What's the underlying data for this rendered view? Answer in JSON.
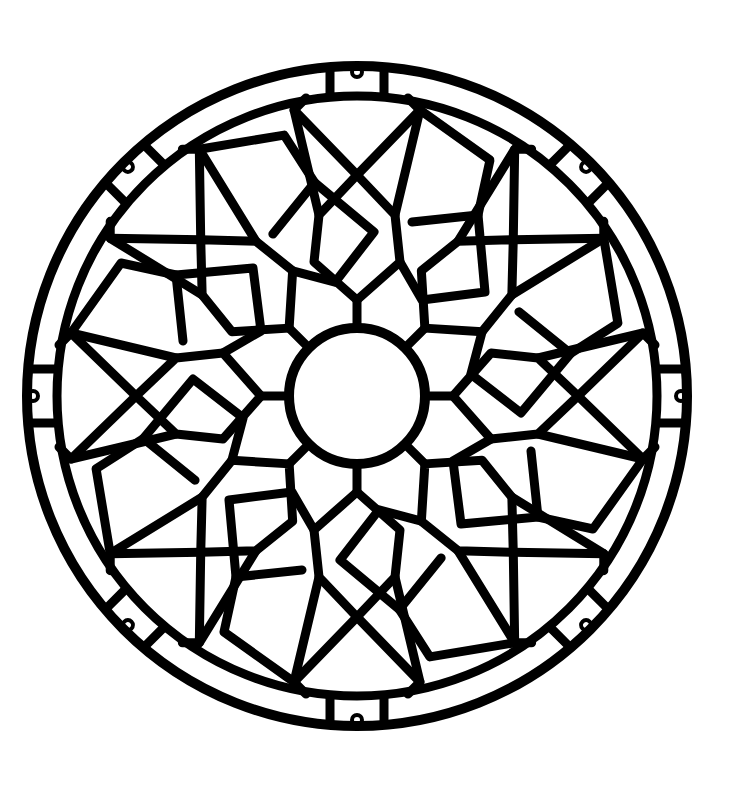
{
  "image": {
    "subject": "circular mandala stained-glass line art",
    "background": "#ffffff",
    "ink": "#000000",
    "center": [
      357,
      396
    ],
    "outer_radius": 333,
    "inner_circle_radius": 68,
    "symmetry": 8
  }
}
